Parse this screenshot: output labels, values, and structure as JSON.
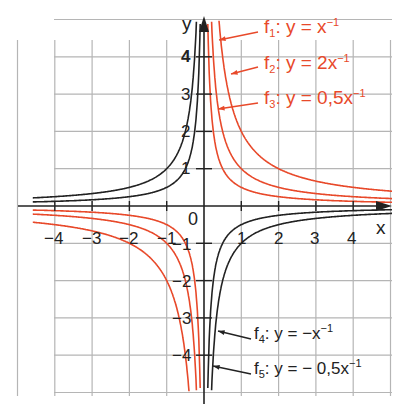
{
  "chart_data": {
    "type": "line",
    "title": "",
    "xlabel": "x",
    "ylabel": "y",
    "xlim": [
      -4.5,
      5
    ],
    "ylim": [
      -5,
      5
    ],
    "grid": true,
    "x_ticks": [
      "-4",
      "-3",
      "-2",
      "-1",
      "0",
      "1",
      "2",
      "3",
      "4"
    ],
    "y_ticks": [
      "4",
      "3",
      "2",
      "1",
      "-1",
      "-2",
      "-3",
      "-4"
    ],
    "origin_label": "0",
    "series": [
      {
        "name": "f1",
        "label": "f1: y = x^-1",
        "k": 1,
        "color": "#e8492a"
      },
      {
        "name": "f2",
        "label": "f2: y = 2x^-1",
        "k": 2,
        "color": "#e8492a"
      },
      {
        "name": "f3",
        "label": "f3: y = 0,5x^-1",
        "k": 0.5,
        "color": "#e8492a"
      },
      {
        "name": "f4",
        "label": "f4: y = -x^-1",
        "k": -1,
        "color": "#222222"
      },
      {
        "name": "f5",
        "label": "f5: y = -0,5x^-1",
        "k": -0.5,
        "color": "#222222"
      }
    ]
  },
  "legend": {
    "f1": {
      "name": "f",
      "sub": "1",
      "eq": ": y = x",
      "sup": "−1"
    },
    "f2": {
      "name": "f",
      "sub": "2",
      "eq": ": y = 2x",
      "sup": "−1"
    },
    "f3": {
      "name": "f",
      "sub": "3",
      "eq": ": y = 0,5x",
      "sup": "−1"
    },
    "f4": {
      "name": "f",
      "sub": "4",
      "eq": ": y = −x",
      "sup": "−1"
    },
    "f5": {
      "name": "f",
      "sub": "5",
      "eq": ": y = − 0,5x",
      "sup": "−1"
    }
  },
  "axes": {
    "x_label": "x",
    "y_label": "y",
    "origin": "0",
    "x_ticks": [
      "−4",
      "−3",
      "−2",
      "−1",
      "1",
      "2",
      "3",
      "4"
    ],
    "y_ticks_pos": [
      "4",
      "3",
      "2",
      "1"
    ],
    "y_ticks_neg": [
      "−1",
      "−2",
      "−3",
      "−4"
    ]
  },
  "colors": {
    "grid": "#b5b5b5",
    "axis": "#222222",
    "red": "#e8492a",
    "black": "#222222"
  }
}
